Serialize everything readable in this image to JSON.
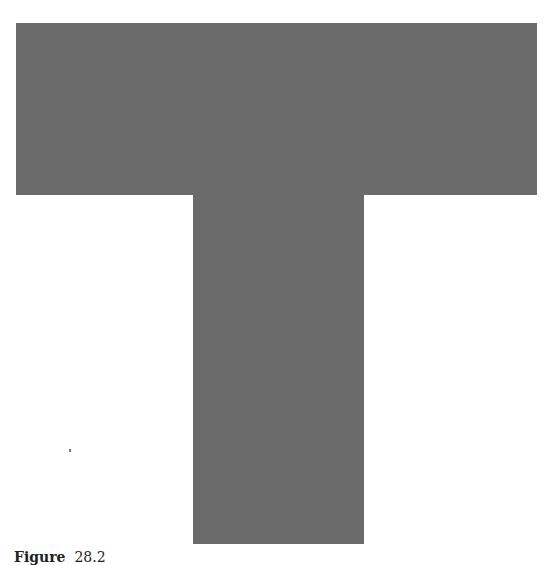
{
  "figure": {
    "shape": "T",
    "fill_color": "#6b6b6b",
    "background_color": "#ffffff",
    "parts": [
      {
        "name": "top-bar",
        "x": 16,
        "y": 23,
        "width": 521,
        "height": 172
      },
      {
        "name": "stem",
        "x": 193,
        "y": 195,
        "width": 171,
        "height": 349
      }
    ]
  },
  "caption": {
    "label": "Figure",
    "number": "28.2"
  }
}
